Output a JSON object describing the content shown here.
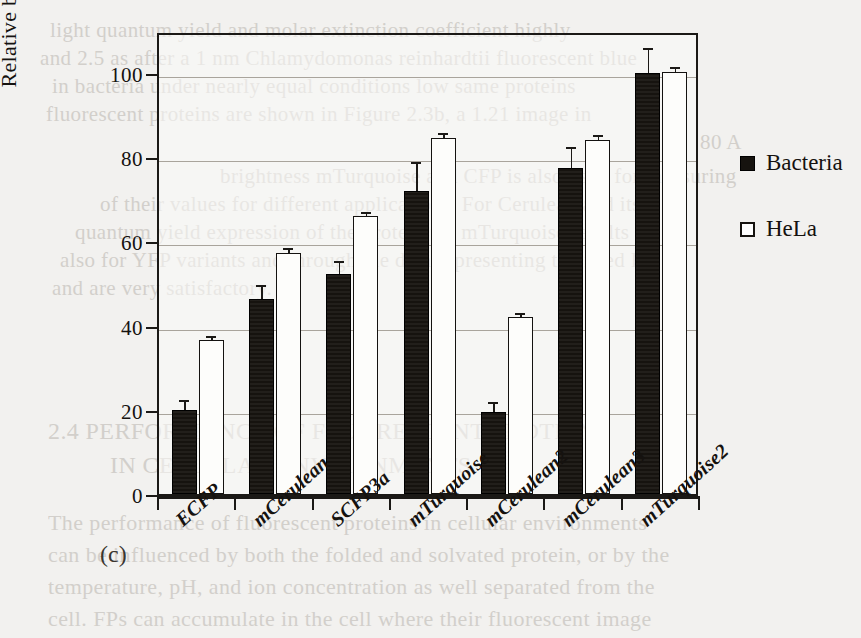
{
  "panel_letter": "(c)",
  "legend": {
    "position": "right",
    "entries": [
      {
        "label": "Bacteria",
        "swatch": "filled-square",
        "color": "#16130f"
      },
      {
        "label": "HeLa",
        "swatch": "open-square",
        "color": "#ffffff"
      }
    ]
  },
  "chart_data": {
    "type": "bar",
    "title": "",
    "subtitle": "",
    "xlabel": "",
    "ylabel": "Relative brightness",
    "ylim": [
      0,
      110
    ],
    "yticks": [
      0,
      20,
      40,
      60,
      80,
      100
    ],
    "ytick_labels": [
      "0",
      "20",
      "40",
      "60",
      "80",
      "100"
    ],
    "grid": "horizontal",
    "categories": [
      "ECFP",
      "mCerulean",
      "SCFP3a",
      "mTurquoise",
      "mCerulean2",
      "mCerulean3",
      "mTurquoise2"
    ],
    "series": [
      {
        "name": "Bacteria",
        "color": "#16130f",
        "values": [
          20.0,
          46.3,
          52.3,
          72.0,
          19.5,
          77.5,
          100.0
        ],
        "errors": [
          1.8,
          3.0,
          2.5,
          6.5,
          2.0,
          4.5,
          5.5
        ]
      },
      {
        "name": "HeLa",
        "color": "#ffffff",
        "values": [
          36.5,
          57.3,
          66.0,
          84.6,
          42.0,
          84.0,
          100.2
        ],
        "errors": [
          0.5,
          0.6,
          0.6,
          0.6,
          0.5,
          0.8,
          0.8
        ]
      }
    ]
  },
  "bleed_text": {
    "lines": [
      {
        "text": "light quantum yield and molar extinction coefficient highly",
        "x": 50,
        "y": 18,
        "size": 21
      },
      {
        "text": "and 2.5 as after a 1 nm Chlamydomonas reinhardtii fluorescent blue",
        "x": 40,
        "y": 46,
        "size": 21
      },
      {
        "text": "in bacteria under nearly equal conditions low same proteins",
        "x": 52,
        "y": 74,
        "size": 21
      },
      {
        "text": "fluorescent proteins are shown in Figure 2.3b, a 1.21 image in",
        "x": 46,
        "y": 102,
        "size": 21
      },
      {
        "text": "80 A",
        "x": 700,
        "y": 130,
        "size": 21
      },
      {
        "text": "brightness mTurquoise and CFP is also used for measuring",
        "x": 220,
        "y": 164,
        "size": 21
      },
      {
        "text": "of their values for different applications. For Cerulean and its",
        "x": 100,
        "y": 192,
        "size": 21
      },
      {
        "text": "quantum yield expression of the protein vs. mTurquoise results",
        "x": 75,
        "y": 220,
        "size": 21
      },
      {
        "text": "also for YFP variants and through the data representing the need FP",
        "x": 60,
        "y": 248,
        "size": 21
      },
      {
        "text": "and are very satisfactory.",
        "x": 52,
        "y": 276,
        "size": 21
      },
      {
        "text": "2.4    PERFORMANCE OF FLUORESCENT PROTEINS",
        "x": 48,
        "y": 418,
        "size": 24
      },
      {
        "text": "IN CELLULAR ENVIRONMENTS",
        "x": 110,
        "y": 452,
        "size": 24
      },
      {
        "text": "The performance of fluorescent proteins in cellular environments",
        "x": 48,
        "y": 510,
        "size": 22
      },
      {
        "text": "can be influenced by both the folded and solvated protein, or by the",
        "x": 48,
        "y": 542,
        "size": 22
      },
      {
        "text": "temperature, pH, and ion concentration as well separated from the",
        "x": 48,
        "y": 574,
        "size": 22
      },
      {
        "text": "cell. FPs can accumulate in the cell where their fluorescent image",
        "x": 48,
        "y": 606,
        "size": 22
      }
    ]
  }
}
